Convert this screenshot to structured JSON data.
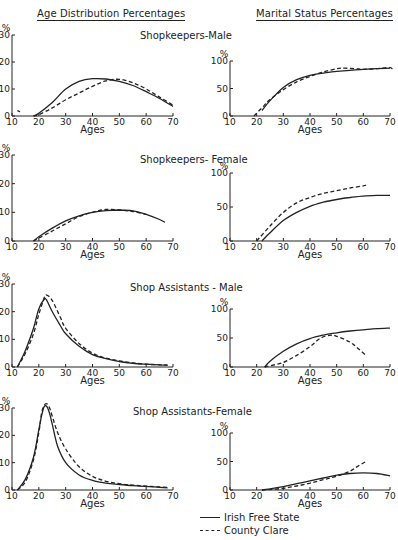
{
  "headers": {
    "left": "Age Distribution Percentages",
    "right": "Marital Status Percentages"
  },
  "legend": [
    {
      "label": "Irish Free State",
      "style": "solid"
    },
    {
      "label": "County Clare",
      "style": "dashed"
    }
  ],
  "panels": [
    {
      "title": "Shopkeepers-Male",
      "title_x": 140,
      "title_y": 36
    },
    {
      "title": "Shopkeepers- Female",
      "title_x": 140,
      "title_y": 160
    },
    {
      "title": "Shop Assistants - Male",
      "title_x": 130,
      "title_y": 288
    },
    {
      "title": "Shop Assistants-Female",
      "title_x": 133,
      "title_y": 412
    }
  ],
  "chart_data": [
    {
      "type": "line",
      "id": "age-shopkeepers-male",
      "title": "Shopkeepers-Male",
      "subtitle": "Age Distribution Percentages",
      "xlabel": "Ages",
      "ylabel": "%",
      "xlim": [
        10,
        70
      ],
      "ylim": [
        0,
        30
      ],
      "xticks": [
        10,
        20,
        30,
        40,
        50,
        60,
        70
      ],
      "yticks": [
        0,
        10,
        20,
        30
      ],
      "box": {
        "x0": 12,
        "x1": 173,
        "y0": 116,
        "y1": 35
      },
      "series": [
        {
          "name": "Irish Free State",
          "style": "solid",
          "x": [
            18,
            20,
            25,
            30,
            35,
            40,
            45,
            50,
            55,
            60,
            65,
            70
          ],
          "y": [
            0,
            1,
            5,
            10,
            12.8,
            13.8,
            13.7,
            12.8,
            11.3,
            9,
            6.5,
            3.5
          ]
        },
        {
          "name": "County Clare",
          "style": "dashed",
          "x": [
            18,
            20,
            25,
            30,
            35,
            40,
            45,
            50,
            55,
            60,
            65,
            70
          ],
          "y": [
            0,
            0.5,
            3,
            6,
            8.5,
            11,
            13,
            13.6,
            12.3,
            10,
            7,
            4
          ]
        },
        {
          "name": "County Clare (isolated mark)",
          "style": "dashed",
          "x": [
            12,
            13
          ],
          "y": [
            2,
            1.6
          ]
        }
      ]
    },
    {
      "type": "line",
      "id": "marital-shopkeepers-male",
      "title": "Shopkeepers-Male",
      "subtitle": "Marital Status Percentages",
      "xlabel": "Ages",
      "ylabel": "%",
      "xlim": [
        10,
        70
      ],
      "ylim": [
        0,
        100
      ],
      "xticks": [
        10,
        20,
        30,
        40,
        50,
        60,
        70
      ],
      "yticks": [
        0,
        50,
        100
      ],
      "box": {
        "x0": 230,
        "x1": 390,
        "y0": 116,
        "y1": 61
      },
      "series": [
        {
          "name": "Irish Free State",
          "style": "solid",
          "x": [
            22,
            25,
            30,
            35,
            40,
            45,
            50,
            55,
            60,
            65,
            70
          ],
          "y": [
            10,
            28,
            52,
            66,
            74,
            78,
            81,
            83,
            85,
            86,
            87
          ]
        },
        {
          "name": "County Clare",
          "style": "dashed",
          "x": [
            19,
            22,
            25,
            30,
            35,
            40,
            45,
            50,
            53,
            57,
            60,
            65,
            70,
            71
          ],
          "y": [
            0,
            15,
            30,
            48,
            62,
            72,
            80,
            86,
            87,
            86,
            85,
            86,
            88,
            83
          ]
        }
      ]
    },
    {
      "type": "line",
      "id": "age-shopkeepers-female",
      "title": "Shopkeepers- Female",
      "subtitle": "Age Distribution Percentages",
      "xlabel": "Ages",
      "ylabel": "%",
      "xlim": [
        10,
        70
      ],
      "ylim": [
        0,
        30
      ],
      "xticks": [
        10,
        20,
        30,
        40,
        50,
        60,
        70
      ],
      "yticks": [
        0,
        10,
        20,
        30
      ],
      "box": {
        "x0": 12,
        "x1": 173,
        "y0": 241,
        "y1": 155
      },
      "series": [
        {
          "name": "Irish Free State",
          "style": "solid",
          "x": [
            18,
            20,
            25,
            30,
            35,
            40,
            45,
            50,
            55,
            60,
            65,
            67
          ],
          "y": [
            0,
            1.5,
            4.5,
            7,
            8.8,
            10,
            10.6,
            10.8,
            10.5,
            9.3,
            7.5,
            6.5
          ]
        },
        {
          "name": "County Clare",
          "style": "dashed",
          "x": [
            18,
            20,
            25,
            30,
            35,
            40,
            45,
            50,
            55,
            60
          ],
          "y": [
            0,
            1,
            3.5,
            6,
            8.5,
            10,
            11,
            10.8,
            10.3,
            9.3
          ]
        }
      ]
    },
    {
      "type": "line",
      "id": "marital-shopkeepers-female",
      "title": "Shopkeepers- Female",
      "subtitle": "Marital Status Percentages",
      "xlabel": "Ages",
      "ylabel": "%",
      "xlim": [
        10,
        70
      ],
      "ylim": [
        0,
        100
      ],
      "xticks": [
        10,
        20,
        30,
        40,
        50,
        60,
        70
      ],
      "yticks": [
        0,
        50,
        100
      ],
      "box": {
        "x0": 230,
        "x1": 390,
        "y0": 241,
        "y1": 173
      },
      "series": [
        {
          "name": "Irish Free State",
          "style": "solid",
          "x": [
            22,
            25,
            30,
            35,
            40,
            45,
            50,
            55,
            60,
            65,
            70
          ],
          "y": [
            0,
            12,
            30,
            42,
            51,
            57,
            61,
            64,
            66,
            67,
            67
          ]
        },
        {
          "name": "County Clare",
          "style": "dashed",
          "x": [
            20,
            25,
            30,
            35,
            40,
            45,
            50,
            55,
            60,
            61
          ],
          "y": [
            0,
            22,
            42,
            56,
            64,
            70,
            74,
            78,
            81,
            82
          ]
        }
      ]
    },
    {
      "type": "line",
      "id": "age-shop-assistants-male",
      "title": "Shop Assistants - Male",
      "subtitle": "Age Distribution Percentages",
      "xlabel": "Ages",
      "ylabel": "%",
      "xlim": [
        10,
        70
      ],
      "ylim": [
        0,
        30
      ],
      "xticks": [
        10,
        20,
        30,
        40,
        50,
        60,
        70
      ],
      "yticks": [
        0,
        10,
        20,
        30
      ],
      "box": {
        "x0": 12,
        "x1": 173,
        "y0": 367,
        "y1": 284
      },
      "series": [
        {
          "name": "Irish Free State",
          "style": "solid",
          "x": [
            12,
            15,
            18,
            20,
            22,
            23,
            25,
            28,
            30,
            35,
            40,
            45,
            50,
            55,
            60,
            65,
            68
          ],
          "y": [
            0,
            6,
            14,
            21,
            24.5,
            24,
            20,
            15,
            12,
            7.5,
            4.5,
            3,
            2,
            1.3,
            1,
            0.8,
            0.7
          ]
        },
        {
          "name": "County Clare",
          "style": "dashed",
          "x": [
            12,
            15,
            18,
            20,
            22,
            23,
            25,
            28,
            30,
            35,
            40,
            45,
            50,
            55,
            60,
            65,
            68
          ],
          "y": [
            0,
            5,
            12,
            19,
            25,
            26,
            24,
            18,
            14,
            8.5,
            5,
            3.2,
            2.2,
            1.5,
            1,
            0.8,
            0.7
          ]
        }
      ]
    },
    {
      "type": "line",
      "id": "marital-shop-assistants-male",
      "title": "Shop Assistants - Male",
      "subtitle": "Marital Status Percentages",
      "xlabel": "Ages",
      "ylabel": "%",
      "xlim": [
        10,
        70
      ],
      "ylim": [
        0,
        100
      ],
      "xticks": [
        10,
        20,
        30,
        40,
        50,
        60,
        70
      ],
      "yticks": [
        0,
        50,
        100
      ],
      "box": {
        "x0": 230,
        "x1": 390,
        "y0": 367,
        "y1": 309
      },
      "series": [
        {
          "name": "Irish Free State",
          "style": "solid",
          "x": [
            23,
            25,
            30,
            35,
            40,
            45,
            50,
            55,
            60,
            65,
            70
          ],
          "y": [
            0,
            10,
            27,
            40,
            49,
            55,
            59,
            62,
            64,
            66,
            67
          ]
        },
        {
          "name": "County Clare",
          "style": "dashed",
          "x": [
            23,
            25,
            30,
            35,
            40,
            44,
            48,
            50,
            55,
            58,
            61
          ],
          "y": [
            0,
            2,
            8,
            20,
            35,
            50,
            55,
            53,
            43,
            32,
            20
          ]
        }
      ]
    },
    {
      "type": "line",
      "id": "age-shop-assistants-female",
      "title": "Shop Assistants-Female",
      "subtitle": "Age Distribution Percentages",
      "xlabel": "Ages",
      "ylabel": "%",
      "xlim": [
        10,
        70
      ],
      "ylim": [
        0,
        30
      ],
      "xticks": [
        10,
        20,
        30,
        40,
        50,
        60,
        70
      ],
      "yticks": [
        0,
        10,
        20,
        30
      ],
      "box": {
        "x0": 12,
        "x1": 173,
        "y0": 490,
        "y1": 408
      },
      "series": [
        {
          "name": "Irish Free State",
          "style": "solid",
          "x": [
            12,
            15,
            18,
            20,
            21,
            22,
            23,
            24,
            25,
            27,
            30,
            35,
            40,
            45,
            50,
            55,
            60,
            65,
            68
          ],
          "y": [
            0,
            4,
            12,
            22,
            27,
            30.5,
            30.5,
            28,
            24,
            16,
            10,
            5.5,
            3.5,
            2.5,
            2,
            1.6,
            1.3,
            1,
            0.8
          ]
        },
        {
          "name": "County Clare",
          "style": "dashed",
          "x": [
            12,
            15,
            18,
            20,
            21,
            22,
            23,
            24,
            25,
            27,
            30,
            35,
            40,
            45,
            50,
            55,
            60,
            65,
            68
          ],
          "y": [
            0,
            3,
            11,
            21,
            28,
            31,
            31.5,
            30,
            27,
            21,
            15,
            8.5,
            5,
            3.2,
            2.3,
            1.8,
            1.4,
            1.1,
            0.9
          ]
        }
      ]
    },
    {
      "type": "line",
      "id": "marital-shop-assistants-female",
      "title": "Shop Assistants-Female",
      "subtitle": "Marital Status Percentages",
      "xlabel": "Ages",
      "ylabel": "%",
      "xlim": [
        10,
        70
      ],
      "ylim": [
        0,
        100
      ],
      "xticks": [
        10,
        20,
        30,
        40,
        50,
        60,
        70
      ],
      "yticks": [
        0,
        50,
        100
      ],
      "box": {
        "x0": 230,
        "x1": 390,
        "y0": 490,
        "y1": 433
      },
      "series": [
        {
          "name": "Irish Free State",
          "style": "solid",
          "x": [
            22,
            25,
            30,
            35,
            40,
            45,
            50,
            55,
            60,
            65,
            70
          ],
          "y": [
            0,
            2,
            6,
            11,
            16,
            21,
            26,
            29,
            30,
            29,
            25
          ]
        },
        {
          "name": "County Clare",
          "style": "dashed",
          "x": [
            22,
            25,
            30,
            35,
            40,
            45,
            50,
            55,
            58,
            61
          ],
          "y": [
            0,
            1,
            3,
            7,
            12,
            18,
            24,
            33,
            42,
            50
          ]
        }
      ]
    }
  ]
}
